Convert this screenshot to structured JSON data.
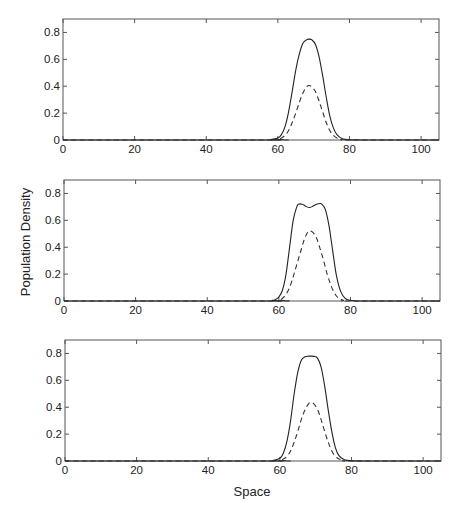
{
  "figure": {
    "ylabel": "Population Density",
    "xlabel": "Space"
  },
  "chart_data": [
    {
      "type": "line",
      "panel": 1,
      "xlabel": "",
      "ylabel": "",
      "xlim": [
        0,
        105
      ],
      "ylim": [
        0,
        0.9
      ],
      "xticks": [
        0,
        20,
        40,
        60,
        80,
        100
      ],
      "xtick_labels": [
        "0",
        "20",
        "40",
        "60",
        "80",
        "100"
      ],
      "yticks": [
        0,
        0.2,
        0.4,
        0.6,
        0.8
      ],
      "ytick_labels": [
        "0",
        "0.2",
        "0.4",
        "0.6",
        "0.8"
      ],
      "grid": false,
      "series": [
        {
          "name": "solid",
          "style": "solid",
          "x": [
            0,
            56,
            58,
            60,
            61,
            62,
            63,
            64,
            65,
            66,
            67,
            68,
            68.7,
            69.5,
            70.5,
            71.5,
            72.5,
            73.5,
            74.5,
            75.5,
            76.5,
            78,
            80,
            84,
            105
          ],
          "y": [
            0,
            0,
            0.003,
            0.015,
            0.04,
            0.1,
            0.21,
            0.36,
            0.52,
            0.64,
            0.72,
            0.745,
            0.75,
            0.745,
            0.71,
            0.62,
            0.48,
            0.32,
            0.18,
            0.09,
            0.04,
            0.01,
            0.002,
            0,
            0
          ]
        },
        {
          "name": "dashed",
          "style": "dashed",
          "x": [
            0,
            58,
            60,
            61,
            62,
            63,
            64,
            65,
            66,
            67,
            68,
            68.7,
            69.5,
            70.5,
            71.5,
            72.5,
            73.5,
            74.5,
            75.5,
            76.5,
            78,
            80,
            105
          ],
          "y": [
            0,
            0,
            0.005,
            0.015,
            0.035,
            0.07,
            0.13,
            0.2,
            0.28,
            0.35,
            0.395,
            0.405,
            0.395,
            0.36,
            0.29,
            0.21,
            0.13,
            0.07,
            0.035,
            0.015,
            0.004,
            0,
            0
          ]
        }
      ]
    },
    {
      "type": "line",
      "panel": 2,
      "xlabel": "",
      "ylabel": "Population Density",
      "xlim": [
        0,
        105
      ],
      "ylim": [
        0,
        0.9
      ],
      "xticks": [
        0,
        20,
        40,
        60,
        80,
        100
      ],
      "xtick_labels": [
        "0",
        "20",
        "40",
        "60",
        "80",
        "100"
      ],
      "yticks": [
        0,
        0.2,
        0.4,
        0.6,
        0.8
      ],
      "ytick_labels": [
        "0",
        "0.2",
        "0.4",
        "0.6",
        "0.8"
      ],
      "grid": false,
      "series": [
        {
          "name": "solid",
          "style": "solid",
          "x": [
            0,
            56,
            58,
            59,
            60,
            61,
            62,
            63,
            64,
            65,
            65.5,
            66.5,
            67.5,
            68.5,
            69.5,
            70.5,
            71.5,
            72,
            73,
            74,
            75,
            76,
            77,
            78,
            79,
            81,
            84,
            105
          ],
          "y": [
            0,
            0,
            0.004,
            0.01,
            0.03,
            0.08,
            0.2,
            0.4,
            0.6,
            0.7,
            0.72,
            0.72,
            0.705,
            0.695,
            0.705,
            0.72,
            0.725,
            0.72,
            0.68,
            0.56,
            0.38,
            0.2,
            0.09,
            0.035,
            0.012,
            0.002,
            0,
            0
          ]
        },
        {
          "name": "dashed",
          "style": "dashed",
          "x": [
            0,
            58,
            60,
            61,
            62,
            63,
            64,
            65,
            66,
            67,
            68,
            68.7,
            69.5,
            70.5,
            71.5,
            72.5,
            73.5,
            74.5,
            75.5,
            76.5,
            78,
            80,
            105
          ],
          "y": [
            0,
            0,
            0.006,
            0.02,
            0.05,
            0.1,
            0.18,
            0.27,
            0.36,
            0.45,
            0.51,
            0.52,
            0.51,
            0.47,
            0.39,
            0.3,
            0.2,
            0.12,
            0.06,
            0.025,
            0.006,
            0,
            0
          ]
        }
      ]
    },
    {
      "type": "line",
      "panel": 3,
      "xlabel": "Space",
      "ylabel": "",
      "xlim": [
        0,
        105
      ],
      "ylim": [
        0,
        0.9
      ],
      "xticks": [
        0,
        20,
        40,
        60,
        80,
        100
      ],
      "xtick_labels": [
        "0",
        "20",
        "40",
        "60",
        "80",
        "100"
      ],
      "yticks": [
        0,
        0.2,
        0.4,
        0.6,
        0.8
      ],
      "ytick_labels": [
        "0",
        "0.2",
        "0.4",
        "0.6",
        "0.8"
      ],
      "grid": false,
      "series": [
        {
          "name": "solid",
          "style": "solid",
          "x": [
            0,
            56,
            58,
            60,
            61,
            62,
            63,
            64,
            65,
            66,
            67,
            68,
            68.7,
            69.5,
            70.5,
            71.5,
            72.5,
            73.5,
            74.5,
            75.5,
            76.5,
            78,
            80,
            84,
            105
          ],
          "y": [
            0,
            0,
            0.003,
            0.02,
            0.06,
            0.15,
            0.3,
            0.5,
            0.66,
            0.75,
            0.775,
            0.78,
            0.78,
            0.778,
            0.765,
            0.7,
            0.56,
            0.38,
            0.22,
            0.1,
            0.04,
            0.01,
            0.002,
            0,
            0
          ]
        },
        {
          "name": "dashed",
          "style": "dashed",
          "x": [
            0,
            58,
            60,
            61,
            62,
            63,
            64,
            65,
            66,
            67,
            68,
            68.7,
            69.5,
            70.5,
            71.5,
            72.5,
            73.5,
            74.5,
            75.5,
            76.5,
            78,
            80,
            105
          ],
          "y": [
            0,
            0,
            0.005,
            0.015,
            0.035,
            0.075,
            0.14,
            0.22,
            0.31,
            0.38,
            0.425,
            0.435,
            0.425,
            0.385,
            0.31,
            0.22,
            0.14,
            0.075,
            0.035,
            0.015,
            0.004,
            0,
            0
          ]
        }
      ]
    }
  ]
}
